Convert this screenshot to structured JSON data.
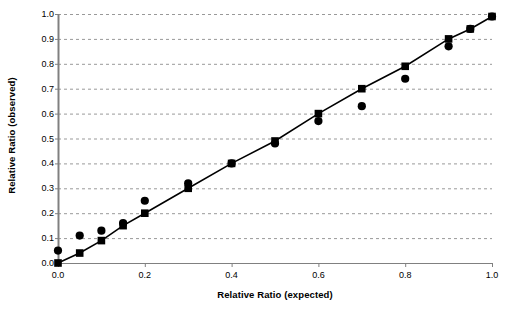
{
  "chart_data": {
    "type": "scatter",
    "title": "",
    "xlabel": "Relative Ratio (expected)",
    "ylabel": "Relative Ratio (observed)",
    "xlim": [
      0.0,
      1.0
    ],
    "ylim": [
      0.0,
      1.0
    ],
    "xticks": [
      "0.0",
      "0.2",
      "0.4",
      "0.6",
      "0.8",
      "1.0"
    ],
    "xtick_values": [
      0.0,
      0.2,
      0.4,
      0.6,
      0.8,
      1.0
    ],
    "yticks": [
      "0.0",
      "0.1",
      "0.2",
      "0.3",
      "0.4",
      "0.5",
      "0.6",
      "0.7",
      "0.8",
      "0.9",
      "1.0"
    ],
    "ytick_values": [
      0.0,
      0.1,
      0.2,
      0.3,
      0.4,
      0.5,
      0.6,
      0.7,
      0.8,
      0.9,
      1.0
    ],
    "grid": {
      "horizontal": true,
      "vertical": false,
      "style": "dashed",
      "color": "#999999"
    },
    "legend": {
      "visible": false,
      "position": "none"
    },
    "series": [
      {
        "name": "series-squares",
        "marker": "square",
        "color": "#000000",
        "connected": true,
        "x": [
          0.0,
          0.05,
          0.1,
          0.15,
          0.2,
          0.3,
          0.4,
          0.5,
          0.6,
          0.7,
          0.8,
          0.9,
          0.95,
          1.0
        ],
        "y": [
          0.0,
          0.04,
          0.09,
          0.15,
          0.2,
          0.3,
          0.4,
          0.49,
          0.6,
          0.7,
          0.79,
          0.9,
          0.94,
          0.99
        ]
      },
      {
        "name": "series-circles",
        "marker": "circle",
        "color": "#000000",
        "connected": false,
        "x": [
          0.0,
          0.05,
          0.1,
          0.15,
          0.2,
          0.3,
          0.4,
          0.5,
          0.6,
          0.7,
          0.8,
          0.9,
          0.95,
          1.0
        ],
        "y": [
          0.05,
          0.11,
          0.13,
          0.16,
          0.25,
          0.32,
          0.4,
          0.48,
          0.57,
          0.63,
          0.74,
          0.87,
          0.94,
          0.99
        ]
      }
    ],
    "axis_color": "#808080",
    "line_color": "#000000",
    "marker_color": "#000000"
  },
  "geometry": {
    "left": 58,
    "right": 492,
    "top": 14,
    "bottom": 263
  }
}
